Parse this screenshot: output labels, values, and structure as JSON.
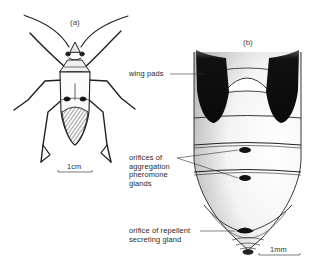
{
  "figure": {
    "panels": [
      {
        "id": "a",
        "label": "(a)",
        "subject": "adult bug, dorsal view",
        "scale_bar": {
          "label": "1cm"
        }
      },
      {
        "id": "b",
        "label": "(b)",
        "subject": "nymph abdomen, dorsal view",
        "scale_bar": {
          "label": "1mm"
        },
        "annotations": [
          {
            "text": "wing pads"
          },
          {
            "lines": [
              "orifices of",
              "aggregation",
              "pheromone",
              "glands"
            ]
          },
          {
            "lines": [
              "orifice of repellent",
              "secreting gland"
            ]
          }
        ]
      }
    ],
    "colors": {
      "background": "#ffffff",
      "ink": "#1a1a1a",
      "label_text": "#2a2a2a",
      "stipple": "#8a8a8a"
    }
  }
}
